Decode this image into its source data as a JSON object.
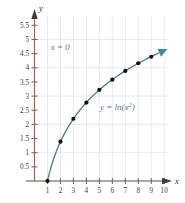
{
  "chart_data": {
    "type": "line",
    "title": "",
    "subtitle": "",
    "xlabel": "x",
    "ylabel": "y",
    "xlim": [
      0,
      10.6
    ],
    "ylim": [
      0,
      5.9
    ],
    "grid": true,
    "legend_position": "inline-annotation",
    "function": "y = ln(x^2)",
    "x": [
      1,
      2,
      3,
      4,
      5,
      6,
      7,
      8,
      9
    ],
    "values": [
      0,
      1.39,
      2.2,
      2.77,
      3.22,
      3.58,
      3.89,
      4.16,
      4.39
    ],
    "series": [
      {
        "name": "y = ln(x^2)",
        "color": "#4a7f96",
        "marker": "filled-circle",
        "x": [
          1,
          2,
          3,
          4,
          5,
          6,
          7,
          8,
          9
        ],
        "values": [
          0,
          1.39,
          2.2,
          2.77,
          3.22,
          3.58,
          3.89,
          4.16,
          4.39
        ]
      }
    ],
    "xticks": [
      1,
      2,
      3,
      4,
      5,
      6,
      7,
      8,
      9,
      10
    ],
    "xtick_labels": [
      "1",
      "2",
      "3",
      "4",
      "5",
      "6",
      "7",
      "8",
      "9",
      "10"
    ],
    "yticks": [
      0.5,
      1,
      1.5,
      2,
      2.5,
      3,
      3.5,
      4,
      4.5,
      5,
      5.5
    ],
    "ytick_labels": [
      "0.5",
      "1",
      "1.5",
      "2",
      "2.5",
      "3",
      "3.5",
      "4",
      "4.5",
      "5",
      "5.5"
    ],
    "annotations": [
      {
        "name": "asymptote-label",
        "text": "x = 0",
        "color": "#c0504d",
        "x": 1.25,
        "y": 4.62
      },
      {
        "name": "curve-equation-label",
        "text_base": "y = ln(x",
        "text_sup": "2",
        "text_close": ")",
        "text": "y = ln(x²)",
        "color": "#4a7f96",
        "x": 5.05,
        "y": 2.52
      }
    ]
  },
  "axes": {
    "x_axis_label": "x",
    "y_axis_label": "y",
    "x_axis_color": "#6b4a45",
    "y_axis_color": "#b05a52",
    "grid_color": "#dde6ee",
    "tick_color": "#6b4a45"
  },
  "colors": {
    "curve": "#4a7f96",
    "marker": "#111111",
    "asymptote_text": "#c0504d",
    "background": "#ffffff"
  }
}
